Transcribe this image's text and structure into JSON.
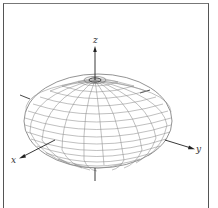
{
  "figure": {
    "type": "ellipsoid-wireframe",
    "axes": {
      "x_label": "x",
      "y_label": "y",
      "z_label": "z"
    },
    "colors": {
      "mesh": "#8a8a8a",
      "axis": "#222222",
      "frame": "#555555"
    }
  }
}
